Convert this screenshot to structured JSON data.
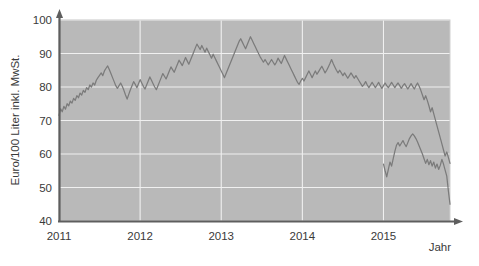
{
  "chart_data": {
    "type": "line",
    "title": "",
    "xlabel": "Jahr",
    "ylabel": "Euro/100 Liter inkl. MwSt.",
    "xlim": [
      2011.0,
      2015.82
    ],
    "ylim": [
      40,
      100
    ],
    "ytick_values": [
      40,
      50,
      60,
      70,
      80,
      90,
      100
    ],
    "ytick_labels": [
      "40",
      "50",
      "60",
      "70",
      "80",
      "90",
      "100"
    ],
    "xtick_values": [
      2011,
      2012,
      2013,
      2014,
      2015
    ],
    "xtick_labels": [
      "2011",
      "2012",
      "2013",
      "2014",
      "2015"
    ],
    "grid": true,
    "legend": null,
    "plot_background_color": "#b9b9b9",
    "gridline_color": "#f0f0f0",
    "series": [
      {
        "name": "Heizölpreis",
        "color": "#7b7b7b",
        "x": [
          2011.0,
          2011.02,
          2011.04,
          2011.06,
          2011.08,
          2011.1,
          2011.12,
          2011.14,
          2011.16,
          2011.18,
          2011.2,
          2011.22,
          2011.24,
          2011.26,
          2011.28,
          2011.3,
          2011.32,
          2011.34,
          2011.36,
          2011.38,
          2011.4,
          2011.42,
          2011.44,
          2011.46,
          2011.48,
          2011.5,
          2011.52,
          2011.54,
          2011.56,
          2011.58,
          2011.6,
          2011.62,
          2011.64,
          2011.66,
          2011.68,
          2011.7,
          2011.72,
          2011.74,
          2011.76,
          2011.78,
          2011.8,
          2011.82,
          2011.84,
          2011.86,
          2011.88,
          2011.9,
          2011.92,
          2011.94,
          2011.96,
          2011.98,
          2012.0,
          2012.02,
          2012.04,
          2012.06,
          2012.08,
          2012.1,
          2012.12,
          2012.14,
          2012.16,
          2012.18,
          2012.2,
          2012.22,
          2012.24,
          2012.26,
          2012.28,
          2012.3,
          2012.32,
          2012.34,
          2012.36,
          2012.38,
          2012.4,
          2012.42,
          2012.44,
          2012.46,
          2012.48,
          2012.5,
          2012.52,
          2012.54,
          2012.56,
          2012.58,
          2012.6,
          2012.62,
          2012.64,
          2012.66,
          2012.68,
          2012.7,
          2012.72,
          2012.74,
          2012.76,
          2012.78,
          2012.8,
          2012.82,
          2012.84,
          2012.86,
          2012.88,
          2012.9,
          2012.92,
          2012.94,
          2012.96,
          2012.98,
          2013.0,
          2013.02,
          2013.04,
          2013.06,
          2013.08,
          2013.1,
          2013.12,
          2013.14,
          2013.16,
          2013.18,
          2013.2,
          2013.22,
          2013.24,
          2013.26,
          2013.28,
          2013.3,
          2013.32,
          2013.34,
          2013.36,
          2013.38,
          2013.4,
          2013.42,
          2013.44,
          2013.46,
          2013.48,
          2013.5,
          2013.52,
          2013.54,
          2013.56,
          2013.58,
          2013.6,
          2013.62,
          2013.64,
          2013.66,
          2013.68,
          2013.7,
          2013.72,
          2013.74,
          2013.76,
          2013.78,
          2013.8,
          2013.82,
          2013.84,
          2013.86,
          2013.88,
          2013.9,
          2013.92,
          2013.94,
          2013.96,
          2013.98,
          2014.0,
          2014.02,
          2014.04,
          2014.06,
          2014.08,
          2014.1,
          2014.12,
          2014.14,
          2014.16,
          2014.18,
          2014.2,
          2014.22,
          2014.24,
          2014.26,
          2014.28,
          2014.3,
          2014.32,
          2014.34,
          2014.36,
          2014.38,
          2014.4,
          2014.42,
          2014.44,
          2014.46,
          2014.48,
          2014.5,
          2014.52,
          2014.54,
          2014.56,
          2014.58,
          2014.6,
          2014.62,
          2014.64,
          2014.66,
          2014.68,
          2014.7,
          2014.72,
          2014.74,
          2014.76,
          2014.78,
          2014.8,
          2014.82,
          2014.84,
          2014.86,
          2014.88,
          2014.9,
          2014.92,
          2014.94,
          2014.96,
          2014.98,
          2015.0,
          2015.02,
          2015.04,
          2015.06,
          2015.08,
          2015.1,
          2015.12,
          2015.14,
          2015.16,
          2015.18,
          2015.2,
          2015.22,
          2015.24,
          2015.26,
          2015.28,
          2015.3,
          2015.32,
          2015.34,
          2015.36,
          2015.38,
          2015.4,
          2015.42,
          2015.44,
          2015.46,
          2015.48,
          2015.5,
          2015.52,
          2015.54,
          2015.56,
          2015.58,
          2015.6,
          2015.62,
          2015.64,
          2015.66,
          2015.68,
          2015.7,
          2015.72,
          2015.74,
          2015.76,
          2015.78,
          2015.8,
          2015.82
        ],
        "y": [
          71.5,
          73.5,
          72.6,
          74.2,
          73.4,
          75.0,
          74.4,
          75.8,
          75.2,
          76.6,
          76.0,
          77.4,
          76.8,
          78.2,
          77.6,
          79.0,
          78.4,
          79.8,
          79.2,
          80.6,
          80.0,
          81.2,
          80.6,
          82.0,
          82.8,
          83.5,
          84.2,
          83.4,
          84.8,
          85.6,
          86.3,
          85.2,
          84.0,
          82.8,
          81.6,
          80.4,
          79.6,
          80.4,
          81.2,
          80.2,
          79.0,
          77.6,
          76.4,
          77.8,
          79.2,
          80.4,
          81.6,
          80.8,
          79.8,
          81.0,
          82.2,
          81.2,
          80.2,
          79.4,
          80.6,
          81.8,
          83.0,
          82.0,
          81.0,
          80.0,
          79.2,
          80.4,
          81.6,
          82.8,
          84.0,
          83.2,
          82.4,
          83.6,
          84.8,
          86.0,
          85.2,
          84.4,
          85.6,
          86.8,
          88.0,
          87.2,
          86.4,
          87.6,
          88.8,
          87.8,
          86.8,
          88.0,
          89.2,
          90.4,
          91.6,
          92.8,
          92.0,
          91.2,
          92.4,
          91.4,
          90.4,
          91.6,
          90.6,
          89.6,
          88.6,
          89.8,
          88.8,
          87.8,
          86.8,
          85.8,
          84.8,
          83.8,
          82.8,
          84.0,
          85.2,
          86.4,
          87.6,
          88.8,
          90.0,
          91.2,
          92.4,
          93.6,
          94.4,
          93.4,
          92.4,
          91.4,
          92.6,
          93.8,
          95.0,
          94.0,
          93.0,
          92.0,
          91.0,
          90.0,
          89.0,
          88.2,
          87.4,
          88.2,
          87.4,
          86.6,
          87.4,
          88.2,
          87.4,
          86.6,
          87.4,
          88.6,
          87.8,
          87.0,
          88.2,
          89.4,
          88.4,
          87.4,
          86.4,
          85.4,
          84.4,
          83.4,
          82.4,
          81.4,
          80.8,
          81.8,
          82.6,
          81.8,
          82.8,
          83.8,
          84.8,
          83.8,
          82.8,
          83.8,
          84.8,
          83.8,
          84.6,
          85.4,
          86.2,
          85.2,
          84.2,
          85.0,
          86.0,
          87.0,
          88.2,
          87.0,
          86.0,
          85.0,
          84.2,
          85.0,
          84.2,
          83.4,
          84.2,
          83.4,
          82.6,
          83.4,
          84.2,
          83.4,
          82.6,
          83.4,
          82.6,
          81.8,
          81.0,
          80.2,
          80.8,
          81.6,
          80.6,
          79.8,
          80.6,
          81.4,
          80.6,
          79.8,
          80.6,
          81.4,
          80.4,
          79.6,
          80.4,
          81.2,
          80.4,
          79.8,
          80.6,
          81.4,
          80.6,
          79.8,
          80.6,
          81.2,
          80.4,
          79.6,
          80.4,
          81.0,
          80.2,
          79.4,
          80.2,
          81.0,
          80.2,
          79.4,
          80.4,
          81.2,
          80.2,
          79.0,
          77.6,
          76.2,
          77.4,
          76.0,
          74.4,
          72.6,
          73.8,
          72.0,
          70.2,
          68.4,
          66.6,
          64.8,
          63.0,
          61.2,
          59.4,
          60.6,
          59.0,
          57.2
        ]
      }
    ],
    "series_extra": {
      "name": "Heizölpreis (2015 Fortsetzung)",
      "x": [
        2015.0,
        2015.02,
        2015.04,
        2015.06,
        2015.08,
        2015.1,
        2015.12,
        2015.14,
        2015.16,
        2015.18,
        2015.2,
        2015.22,
        2015.24,
        2015.26,
        2015.28,
        2015.3,
        2015.32,
        2015.34,
        2015.36,
        2015.38,
        2015.4,
        2015.42,
        2015.44,
        2015.46,
        2015.48,
        2015.5,
        2015.52,
        2015.54,
        2015.56,
        2015.58,
        2015.6,
        2015.62,
        2015.64,
        2015.66,
        2015.68,
        2015.7,
        2015.72,
        2015.74,
        2015.76,
        2015.78,
        2015.8,
        2015.82
      ],
      "y": [
        57.0,
        55.0,
        53.2,
        55.4,
        57.6,
        56.4,
        58.6,
        60.8,
        62.6,
        63.4,
        62.4,
        63.2,
        64.0,
        63.0,
        62.2,
        63.4,
        64.6,
        65.4,
        66.0,
        65.4,
        64.6,
        63.6,
        62.4,
        61.2,
        60.0,
        58.6,
        57.2,
        58.4,
        56.8,
        58.0,
        56.4,
        57.6,
        55.8,
        57.0,
        55.4,
        56.6,
        58.4,
        57.0,
        55.2,
        53.4,
        49.0,
        45.0
      ]
    },
    "annotations": []
  },
  "axes": {
    "y_axis_title": "Euro/100 Liter inkl. MwSt.",
    "x_axis_title": "Jahr"
  }
}
